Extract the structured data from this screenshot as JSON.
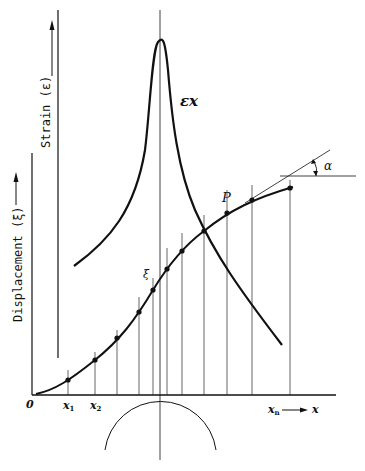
{
  "diagram": {
    "type": "strain-displacement construction",
    "labels": {
      "strain_axis": "Strain (ε)",
      "displacement_axis": "Displacement (ξ)",
      "strain_curve": "εx",
      "displacement_point": "ξ",
      "tangent_point": "P",
      "angle": "α",
      "origin": "0",
      "x1": "x",
      "x1_sub": "1",
      "x2": "x",
      "x2_sub": "2",
      "xn": "x",
      "xn_sub": "n",
      "x_axis": "x"
    },
    "colors": {
      "ink": "#111111",
      "background": "#ffffff"
    },
    "ordinate_x_positions": [
      68,
      95,
      117,
      139,
      153,
      160,
      167,
      182,
      204,
      227,
      252,
      290
    ],
    "displacement_points": [
      [
        68,
        380
      ],
      [
        95,
        360
      ],
      [
        117,
        338
      ],
      [
        139,
        312
      ],
      [
        153,
        290
      ],
      [
        167,
        269
      ],
      [
        182,
        251
      ],
      [
        204,
        231
      ],
      [
        227,
        213
      ],
      [
        252,
        200
      ],
      [
        290,
        188
      ]
    ]
  }
}
